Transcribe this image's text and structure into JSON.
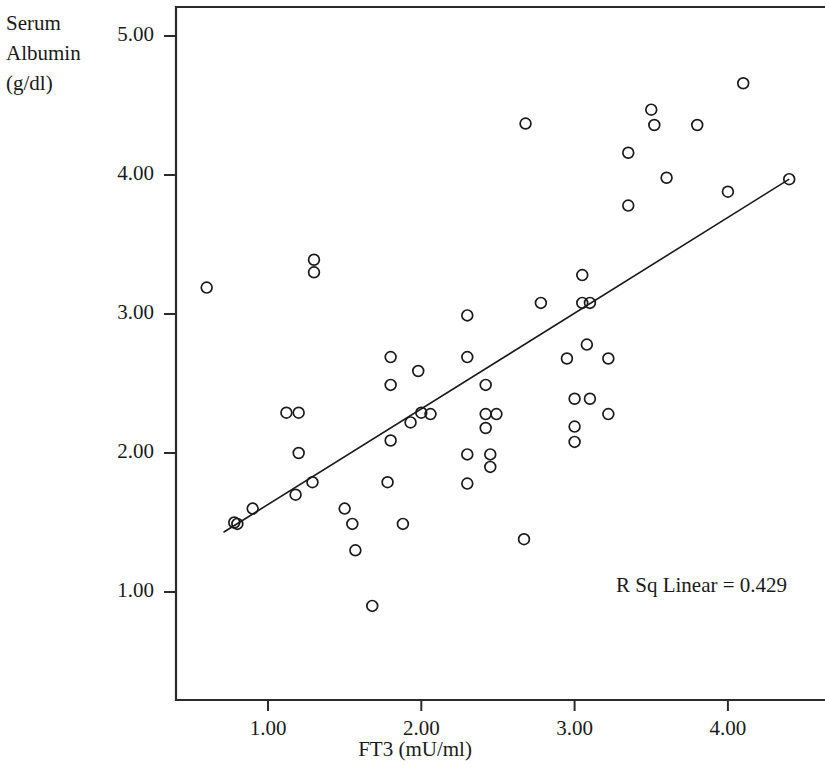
{
  "chart_data": {
    "type": "scatter",
    "title": "",
    "ylabel": "Serum Albumin (g/dl)",
    "ylabel_lines": [
      "Serum",
      "Albumin",
      "(g/dl)"
    ],
    "xlabel": "FT3 (mU/ml)",
    "xlim": [
      0.39,
      4.6
    ],
    "ylim": [
      0.37,
      5.2
    ],
    "xticks": [
      1.0,
      2.0,
      3.0,
      4.0
    ],
    "xtick_labels": [
      "1.00",
      "2.00",
      "3.00",
      "4.00"
    ],
    "yticks": [
      1.0,
      2.0,
      3.0,
      4.0,
      5.0
    ],
    "ytick_labels": [
      "1.00",
      "2.00",
      "3.00",
      "4.00",
      "5.00"
    ],
    "grid": false,
    "legend": null,
    "marker": "open-circle",
    "marker_color": "#1a1a1a",
    "annotation": "R Sq Linear = 0.429",
    "r_squared": 0.429,
    "fit_line": {
      "type": "linear",
      "x_start": 0.71,
      "y_start": 1.43,
      "x_end": 4.4,
      "y_end": 3.97,
      "color": "#1a1a1a"
    },
    "points": [
      {
        "x": 0.6,
        "y": 3.19
      },
      {
        "x": 0.78,
        "y": 1.5
      },
      {
        "x": 0.8,
        "y": 1.49
      },
      {
        "x": 0.9,
        "y": 1.6
      },
      {
        "x": 1.12,
        "y": 2.29
      },
      {
        "x": 1.2,
        "y": 2.29
      },
      {
        "x": 1.2,
        "y": 2.0
      },
      {
        "x": 1.18,
        "y": 1.7
      },
      {
        "x": 1.29,
        "y": 1.79
      },
      {
        "x": 1.3,
        "y": 3.39
      },
      {
        "x": 1.3,
        "y": 3.3
      },
      {
        "x": 1.5,
        "y": 1.6
      },
      {
        "x": 1.55,
        "y": 1.49
      },
      {
        "x": 1.57,
        "y": 1.3
      },
      {
        "x": 1.68,
        "y": 0.9
      },
      {
        "x": 1.78,
        "y": 1.79
      },
      {
        "x": 1.8,
        "y": 2.69
      },
      {
        "x": 1.8,
        "y": 2.49
      },
      {
        "x": 1.8,
        "y": 2.09
      },
      {
        "x": 1.88,
        "y": 1.49
      },
      {
        "x": 1.93,
        "y": 2.22
      },
      {
        "x": 1.98,
        "y": 2.59
      },
      {
        "x": 2.0,
        "y": 2.29
      },
      {
        "x": 2.06,
        "y": 2.28
      },
      {
        "x": 2.3,
        "y": 2.69
      },
      {
        "x": 2.3,
        "y": 2.99
      },
      {
        "x": 2.3,
        "y": 1.99
      },
      {
        "x": 2.3,
        "y": 1.78
      },
      {
        "x": 2.42,
        "y": 2.49
      },
      {
        "x": 2.42,
        "y": 2.28
      },
      {
        "x": 2.42,
        "y": 2.18
      },
      {
        "x": 2.45,
        "y": 1.99
      },
      {
        "x": 2.45,
        "y": 1.9
      },
      {
        "x": 2.49,
        "y": 2.28
      },
      {
        "x": 2.67,
        "y": 1.38
      },
      {
        "x": 2.78,
        "y": 3.08
      },
      {
        "x": 2.95,
        "y": 2.68
      },
      {
        "x": 3.0,
        "y": 2.39
      },
      {
        "x": 3.0,
        "y": 2.19
      },
      {
        "x": 3.0,
        "y": 2.08
      },
      {
        "x": 3.05,
        "y": 3.08
      },
      {
        "x": 3.05,
        "y": 3.28
      },
      {
        "x": 3.08,
        "y": 2.78
      },
      {
        "x": 3.1,
        "y": 3.08
      },
      {
        "x": 3.1,
        "y": 2.39
      },
      {
        "x": 3.22,
        "y": 2.68
      },
      {
        "x": 3.22,
        "y": 2.28
      },
      {
        "x": 3.35,
        "y": 4.16
      },
      {
        "x": 3.35,
        "y": 3.78
      },
      {
        "x": 3.5,
        "y": 4.47
      },
      {
        "x": 3.52,
        "y": 4.36
      },
      {
        "x": 3.6,
        "y": 3.98
      },
      {
        "x": 3.8,
        "y": 4.36
      },
      {
        "x": 4.0,
        "y": 3.88
      },
      {
        "x": 4.1,
        "y": 4.66
      },
      {
        "x": 2.68,
        "y": 4.37
      },
      {
        "x": 4.4,
        "y": 3.97
      }
    ]
  },
  "axes_geometry": {
    "plot_left_px": 176,
    "plot_top_px": 7,
    "plot_right_px": 824,
    "plot_bottom_px": 700,
    "x_origin_px": 268,
    "x_unit_px": 153.3,
    "y_origin_px": 592,
    "y_unit_px": 139
  }
}
